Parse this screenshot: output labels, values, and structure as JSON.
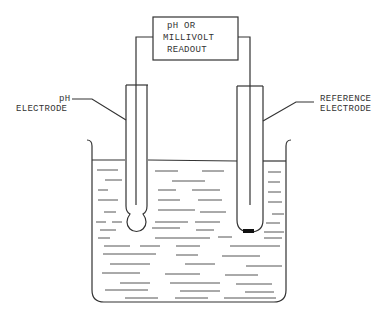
{
  "diagram": {
    "readout": {
      "lines": [
        "pH OR",
        "MILLIVOLT",
        "READOUT"
      ]
    },
    "labels": {
      "ph_electrode": [
        "pH",
        "ELECTRODE"
      ],
      "reference_electrode": [
        "REFERENCE",
        "ELECTRODE"
      ]
    },
    "components": [
      "readout box",
      "pH electrode",
      "reference electrode",
      "beaker",
      "solution"
    ],
    "colors": {
      "line": "#333333",
      "background": "#ffffff",
      "reference_tip": "#111111"
    }
  }
}
